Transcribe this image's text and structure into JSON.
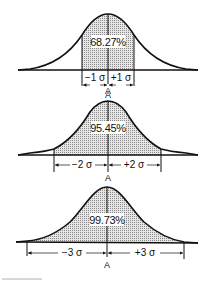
{
  "figure": {
    "colors": {
      "ink": "#111111",
      "shade": "#c8c8c8",
      "background": "#ffffff"
    },
    "panels": [
      {
        "percentage": "68.27%",
        "left_label": "−1 σ",
        "right_label": "+1 σ",
        "center_label": "A",
        "sigma": 1
      },
      {
        "percentage": "95.45%",
        "left_label": "−2 σ",
        "right_label": "+2 σ",
        "center_label": "A",
        "sigma": 2
      },
      {
        "percentage": "99.73%",
        "left_label": "−3 σ",
        "right_label": "+3 σ",
        "center_label": "A",
        "sigma": 3
      }
    ]
  }
}
